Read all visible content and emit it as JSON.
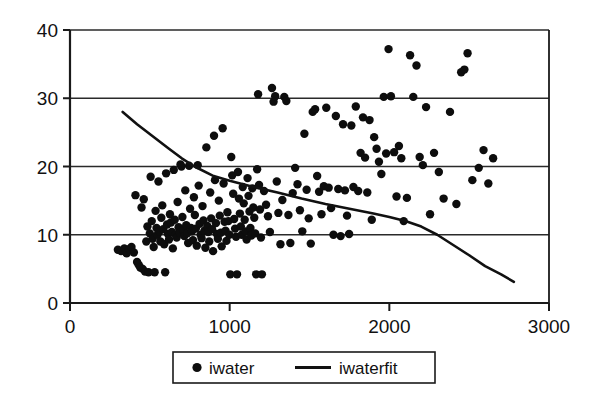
{
  "chart_data": {
    "type": "scatter",
    "title": "",
    "xlabel": "",
    "ylabel": "",
    "xlim": [
      0,
      3000
    ],
    "ylim": [
      0,
      40
    ],
    "xticks": [
      0,
      1000,
      2000,
      3000
    ],
    "yticks": [
      0,
      10,
      20,
      30,
      40
    ],
    "xtick_labels": [
      "0",
      "1000",
      "2000",
      "3000"
    ],
    "ytick_labels": [
      "0",
      "10",
      "20",
      "30",
      "40"
    ],
    "grid": "horizontal",
    "legend_position": "below-center",
    "series": [
      {
        "name": "iwater",
        "type": "scatter",
        "marker": "circle",
        "color": "#0d0d0d",
        "points": [
          [
            300,
            7.8
          ],
          [
            320,
            7.6
          ],
          [
            340,
            8.0
          ],
          [
            355,
            7.3
          ],
          [
            370,
            7.9
          ],
          [
            385,
            8.2
          ],
          [
            400,
            7.4
          ],
          [
            410,
            15.8
          ],
          [
            420,
            6.0
          ],
          [
            430,
            5.6
          ],
          [
            440,
            5.2
          ],
          [
            448,
            14.0
          ],
          [
            455,
            5.0
          ],
          [
            462,
            15.2
          ],
          [
            470,
            4.6
          ],
          [
            478,
            9.0
          ],
          [
            485,
            11.2
          ],
          [
            492,
            4.5
          ],
          [
            500,
            10.2
          ],
          [
            505,
            18.5
          ],
          [
            512,
            12.0
          ],
          [
            518,
            9.4
          ],
          [
            524,
            8.2
          ],
          [
            530,
            4.5
          ],
          [
            536,
            13.5
          ],
          [
            542,
            11.0
          ],
          [
            548,
            10.0
          ],
          [
            554,
            17.8
          ],
          [
            560,
            10.5
          ],
          [
            566,
            9.0
          ],
          [
            572,
            12.5
          ],
          [
            578,
            14.3
          ],
          [
            584,
            10.8
          ],
          [
            590,
            8.6
          ],
          [
            596,
            4.5
          ],
          [
            602,
            19.0
          ],
          [
            608,
            11.5
          ],
          [
            614,
            10.1
          ],
          [
            620,
            9.3
          ],
          [
            626,
            13.0
          ],
          [
            632,
            11.8
          ],
          [
            638,
            10.4
          ],
          [
            644,
            8.0
          ],
          [
            650,
            19.5
          ],
          [
            656,
            12.2
          ],
          [
            662,
            10.0
          ],
          [
            668,
            9.6
          ],
          [
            674,
            14.8
          ],
          [
            680,
            11.1
          ],
          [
            686,
            10.3
          ],
          [
            692,
            20.3
          ],
          [
            698,
            20.0
          ],
          [
            704,
            12.6
          ],
          [
            710,
            10.7
          ],
          [
            716,
            9.8
          ],
          [
            722,
            16.5
          ],
          [
            728,
            11.4
          ],
          [
            734,
            10.2
          ],
          [
            740,
            8.8
          ],
          [
            746,
            20.1
          ],
          [
            752,
            13.8
          ],
          [
            758,
            11.0
          ],
          [
            764,
            10.5
          ],
          [
            770,
            9.2
          ],
          [
            776,
            15.5
          ],
          [
            782,
            12.9
          ],
          [
            788,
            10.9
          ],
          [
            794,
            8.4
          ],
          [
            800,
            20.2
          ],
          [
            806,
            17.2
          ],
          [
            812,
            11.6
          ],
          [
            818,
            10.0
          ],
          [
            824,
            9.5
          ],
          [
            830,
            14.2
          ],
          [
            836,
            12.1
          ],
          [
            842,
            10.6
          ],
          [
            848,
            8.1
          ],
          [
            854,
            22.8
          ],
          [
            860,
            11.3
          ],
          [
            866,
            10.4
          ],
          [
            872,
            9.0
          ],
          [
            878,
            16.2
          ],
          [
            884,
            12.4
          ],
          [
            890,
            10.8
          ],
          [
            896,
            7.6
          ],
          [
            902,
            24.5
          ],
          [
            908,
            18.0
          ],
          [
            914,
            11.7
          ],
          [
            920,
            10.1
          ],
          [
            926,
            9.4
          ],
          [
            932,
            15.0
          ],
          [
            938,
            12.8
          ],
          [
            944,
            10.3
          ],
          [
            950,
            8.3
          ],
          [
            956,
            25.6
          ],
          [
            962,
            17.5
          ],
          [
            968,
            11.9
          ],
          [
            974,
            10.6
          ],
          [
            980,
            9.1
          ],
          [
            986,
            13.3
          ],
          [
            992,
            12.0
          ],
          [
            998,
            10.0
          ],
          [
            1004,
            4.2
          ],
          [
            1010,
            21.4
          ],
          [
            1016,
            18.7
          ],
          [
            1022,
            16.0
          ],
          [
            1028,
            12.3
          ],
          [
            1034,
            10.9
          ],
          [
            1040,
            9.7
          ],
          [
            1046,
            4.2
          ],
          [
            1052,
            19.2
          ],
          [
            1058,
            15.3
          ],
          [
            1064,
            13.1
          ],
          [
            1070,
            11.2
          ],
          [
            1076,
            10.0
          ],
          [
            1082,
            17.0
          ],
          [
            1088,
            14.6
          ],
          [
            1094,
            12.2
          ],
          [
            1100,
            10.5
          ],
          [
            1106,
            9.3
          ],
          [
            1112,
            18.3
          ],
          [
            1118,
            15.7
          ],
          [
            1124,
            13.4
          ],
          [
            1130,
            11.0
          ],
          [
            1136,
            9.9
          ],
          [
            1142,
            16.8
          ],
          [
            1148,
            14.0
          ],
          [
            1154,
            12.5
          ],
          [
            1160,
            10.2
          ],
          [
            1166,
            4.2
          ],
          [
            1172,
            19.6
          ],
          [
            1178,
            30.6
          ],
          [
            1184,
            17.3
          ],
          [
            1190,
            13.7
          ],
          [
            1196,
            9.6
          ],
          [
            1202,
            4.2
          ],
          [
            1215,
            16.4
          ],
          [
            1228,
            14.4
          ],
          [
            1240,
            12.7
          ],
          [
            1252,
            10.4
          ],
          [
            1265,
            31.5
          ],
          [
            1275,
            29.5
          ],
          [
            1285,
            30.3
          ],
          [
            1295,
            17.8
          ],
          [
            1305,
            13.2
          ],
          [
            1318,
            8.6
          ],
          [
            1330,
            15.1
          ],
          [
            1342,
            30.2
          ],
          [
            1355,
            29.6
          ],
          [
            1368,
            12.9
          ],
          [
            1380,
            8.8
          ],
          [
            1395,
            16.1
          ],
          [
            1410,
            19.8
          ],
          [
            1425,
            17.4
          ],
          [
            1440,
            13.6
          ],
          [
            1455,
            10.5
          ],
          [
            1468,
            24.8
          ],
          [
            1482,
            16.6
          ],
          [
            1495,
            12.4
          ],
          [
            1508,
            8.7
          ],
          [
            1520,
            28.0
          ],
          [
            1535,
            28.4
          ],
          [
            1548,
            18.6
          ],
          [
            1560,
            16.3
          ],
          [
            1575,
            13.0
          ],
          [
            1590,
            17.1
          ],
          [
            1605,
            28.6
          ],
          [
            1620,
            16.9
          ],
          [
            1635,
            13.9
          ],
          [
            1650,
            10.0
          ],
          [
            1665,
            27.4
          ],
          [
            1680,
            16.7
          ],
          [
            1695,
            9.8
          ],
          [
            1710,
            26.2
          ],
          [
            1722,
            16.5
          ],
          [
            1735,
            12.8
          ],
          [
            1748,
            10.1
          ],
          [
            1762,
            26.0
          ],
          [
            1775,
            17.0
          ],
          [
            1790,
            28.8
          ],
          [
            1805,
            16.4
          ],
          [
            1820,
            22.0
          ],
          [
            1835,
            27.2
          ],
          [
            1848,
            21.3
          ],
          [
            1862,
            16.2
          ],
          [
            1876,
            26.8
          ],
          [
            1890,
            12.2
          ],
          [
            1905,
            24.3
          ],
          [
            1920,
            22.6
          ],
          [
            1935,
            20.7
          ],
          [
            1950,
            18.9
          ],
          [
            1965,
            30.2
          ],
          [
            1980,
            21.9
          ],
          [
            1995,
            37.2
          ],
          [
            2010,
            30.3
          ],
          [
            2030,
            22.1
          ],
          [
            2045,
            15.6
          ],
          [
            2060,
            23.0
          ],
          [
            2075,
            21.2
          ],
          [
            2090,
            12.0
          ],
          [
            2110,
            15.4
          ],
          [
            2130,
            36.3
          ],
          [
            2150,
            30.2
          ],
          [
            2170,
            34.8
          ],
          [
            2190,
            21.4
          ],
          [
            2210,
            20.2
          ],
          [
            2230,
            28.7
          ],
          [
            2255,
            13.0
          ],
          [
            2280,
            22.0
          ],
          [
            2310,
            19.2
          ],
          [
            2340,
            15.3
          ],
          [
            2380,
            28.0
          ],
          [
            2420,
            14.5
          ],
          [
            2450,
            33.8
          ],
          [
            2470,
            34.2
          ],
          [
            2490,
            36.6
          ],
          [
            2520,
            18.0
          ],
          [
            2560,
            19.8
          ],
          [
            2590,
            22.4
          ],
          [
            2620,
            17.5
          ],
          [
            2650,
            21.2
          ]
        ]
      },
      {
        "name": "iwaterfit",
        "type": "line",
        "color": "#111111",
        "points": [
          [
            330,
            28.0
          ],
          [
            420,
            26.2
          ],
          [
            520,
            24.4
          ],
          [
            620,
            22.6
          ],
          [
            700,
            21.2
          ],
          [
            780,
            20.0
          ],
          [
            900,
            18.6
          ],
          [
            1000,
            17.9
          ],
          [
            1150,
            17.0
          ],
          [
            1300,
            16.2
          ],
          [
            1450,
            15.3
          ],
          [
            1600,
            14.5
          ],
          [
            1750,
            13.8
          ],
          [
            1900,
            13.1
          ],
          [
            2000,
            12.6
          ],
          [
            2100,
            12.0
          ],
          [
            2200,
            11.2
          ],
          [
            2300,
            10.0
          ],
          [
            2400,
            8.5
          ],
          [
            2500,
            7.0
          ],
          [
            2600,
            5.4
          ],
          [
            2700,
            4.2
          ],
          [
            2780,
            3.1
          ]
        ]
      }
    ]
  },
  "legend": {
    "items": [
      {
        "label": "iwater",
        "marker": "dot"
      },
      {
        "label": "iwaterfit",
        "marker": "line"
      }
    ]
  }
}
